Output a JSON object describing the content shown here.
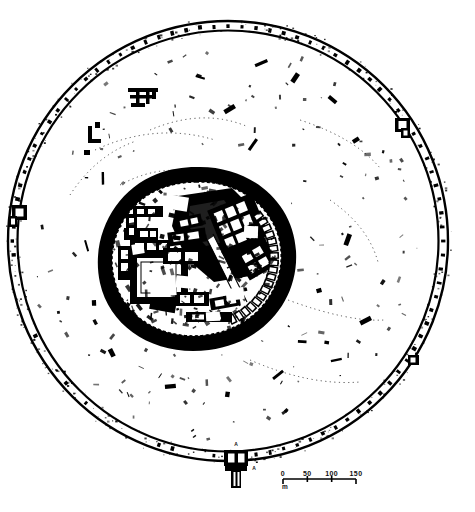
{
  "figure": {
    "kind": "archaeological-site-plan",
    "ink_color": "#000000",
    "background_color": "#ffffff"
  },
  "scalebar": {
    "ticks": [
      "0",
      "50",
      "100",
      "150"
    ],
    "unit": "m",
    "bar_start_px": 283,
    "bar_end_px": 356,
    "bar_y_px": 479,
    "segment_count": 3
  },
  "labels": {
    "south_gate_upper": "A",
    "south_gate_lower": "A"
  },
  "outer_rampart": {
    "name": "outer-circular-rampart",
    "center_px": [
      228,
      241
    ],
    "outer_radius_px": 222,
    "inner_radius_px": 210,
    "line_style": "double-line-with-towers",
    "tower_count": 96,
    "gates": [
      {
        "id": "south-gate",
        "angle_deg": 90,
        "has_barbican": true
      },
      {
        "id": "west-gate",
        "angle_deg": 180,
        "has_barbican": false
      },
      {
        "id": "east-gate",
        "angle_deg": 348,
        "has_barbican": false
      },
      {
        "id": "south-east-gate",
        "angle_deg": 55,
        "has_barbican": false
      }
    ]
  },
  "citadel": {
    "name": "inner-citadel",
    "shape": "oval-teardrop",
    "center_px": [
      196,
      258
    ],
    "radius_x_px": 92,
    "radius_y_px": 85,
    "wall_style": "thick-solid-with-dashed-inner-face",
    "building_blocks": 46,
    "courtyards": 5
  },
  "outer_area_ruins": {
    "name": "scattered-ruins",
    "cluster_count": 9,
    "speckle_count": 190
  }
}
